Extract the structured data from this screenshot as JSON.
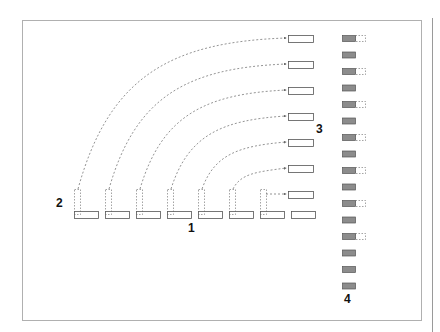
{
  "labels": {
    "one": "1",
    "two": "2",
    "three": "3",
    "four": "4"
  },
  "colors": {
    "frame": "#b0b0b0",
    "box_stroke": "#555555",
    "dashed": "#666666",
    "grey_fill": "#8c8c8c"
  },
  "bottom_row": {
    "count": 8,
    "x_start": 74,
    "step": 31,
    "y": 211,
    "width": 24,
    "height": 7
  },
  "right_column": {
    "count": 7,
    "x": 288,
    "y_start": 35,
    "step": 26,
    "width": 25,
    "height": 7
  },
  "grey_column": {
    "count": 16,
    "x": 342,
    "y_start": 35,
    "step": 16.5,
    "width": 13,
    "height": 6,
    "dashed_ext_indices": [
      0,
      2,
      4,
      6,
      8,
      10,
      12
    ]
  }
}
